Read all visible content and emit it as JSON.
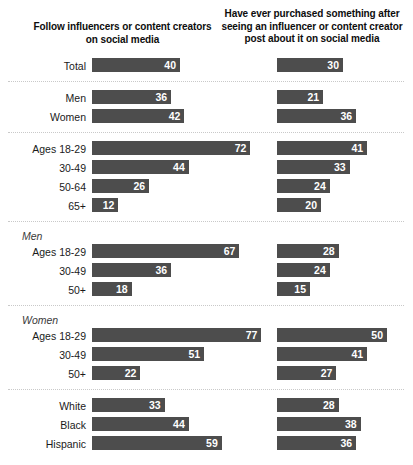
{
  "headers": {
    "col1": "Follow influencers or content creators on social media",
    "col2": "Have ever purchased something after seeing an influencer or content creator post about it on social media"
  },
  "style": {
    "bar_color": "#4d4d4d",
    "value_color": "#ffffff",
    "separator_color": "#c9c9c9",
    "background": "#ffffff"
  },
  "chart_data": {
    "type": "bar",
    "title": "",
    "xlabel": "",
    "ylabel": "",
    "xlim": [
      0,
      100
    ],
    "grid": false,
    "orientation": "horizontal",
    "legend": "none",
    "series": [
      {
        "name": "Follow influencers or content creators on social media",
        "values": [
          40,
          36,
          42,
          72,
          44,
          26,
          12,
          67,
          36,
          18,
          77,
          51,
          22,
          33,
          44,
          59
        ]
      },
      {
        "name": "Have ever purchased something after seeing an influencer or content creator post about it on social media",
        "values": [
          30,
          21,
          36,
          41,
          33,
          24,
          20,
          28,
          24,
          15,
          50,
          41,
          27,
          28,
          38,
          36
        ]
      }
    ],
    "categories": [
      "Total",
      "Men",
      "Women",
      "Ages 18-29",
      "30-49",
      "50-64",
      "65+",
      "Ages 18-29",
      "30-49",
      "50+",
      "Ages 18-29",
      "30-49",
      "50+",
      "White",
      "Black",
      "Hispanic"
    ]
  },
  "groups": [
    {
      "heading": null,
      "rows": [
        {
          "label": "Total",
          "col1": 40,
          "col2": 30
        }
      ]
    },
    {
      "heading": null,
      "rows": [
        {
          "label": "Men",
          "col1": 36,
          "col2": 21
        },
        {
          "label": "Women",
          "col1": 42,
          "col2": 36
        }
      ]
    },
    {
      "heading": null,
      "rows": [
        {
          "label": "Ages 18-29",
          "col1": 72,
          "col2": 41
        },
        {
          "label": "30-49",
          "col1": 44,
          "col2": 33
        },
        {
          "label": "50-64",
          "col1": 26,
          "col2": 24
        },
        {
          "label": "65+",
          "col1": 12,
          "col2": 20
        }
      ]
    },
    {
      "heading": "Men",
      "rows": [
        {
          "label": "Ages 18-29",
          "col1": 67,
          "col2": 28
        },
        {
          "label": "30-49",
          "col1": 36,
          "col2": 24
        },
        {
          "label": "50+",
          "col1": 18,
          "col2": 15
        }
      ]
    },
    {
      "heading": "Women",
      "rows": [
        {
          "label": "Ages 18-29",
          "col1": 77,
          "col2": 50
        },
        {
          "label": "30-49",
          "col1": 51,
          "col2": 41
        },
        {
          "label": "50+",
          "col1": 22,
          "col2": 27
        }
      ]
    },
    {
      "heading": null,
      "rows": [
        {
          "label": "White",
          "col1": 33,
          "col2": 28
        },
        {
          "label": "Black",
          "col1": 44,
          "col2": 38
        },
        {
          "label": "Hispanic",
          "col1": 59,
          "col2": 36
        }
      ]
    }
  ]
}
